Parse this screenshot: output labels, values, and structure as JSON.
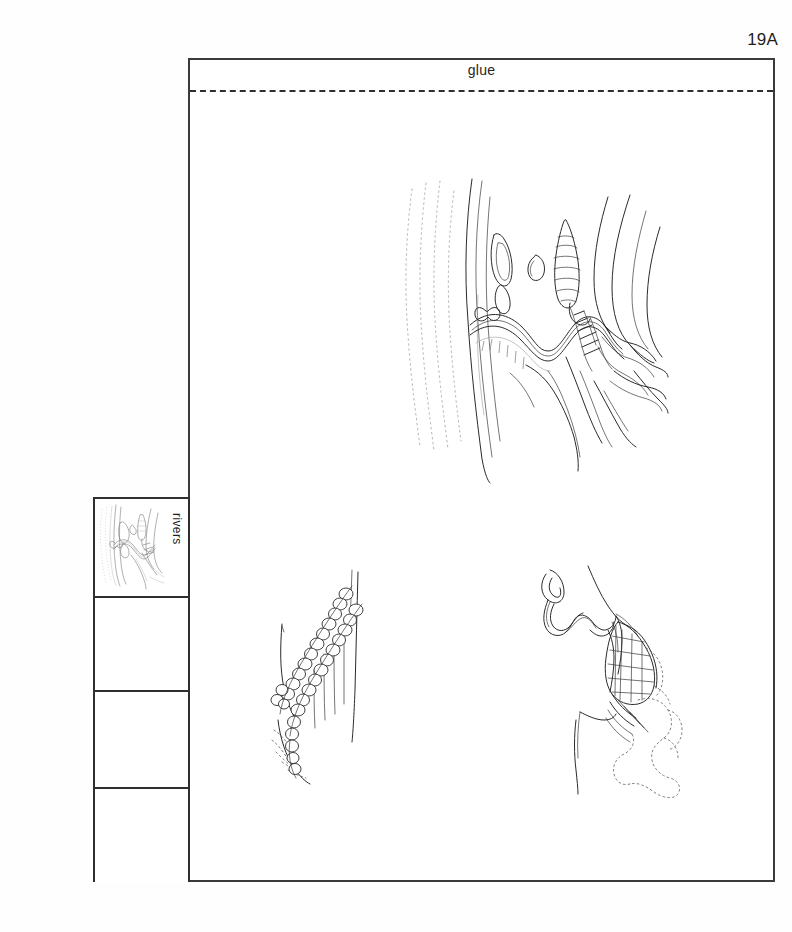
{
  "page": {
    "number_label": "19A",
    "background_color": "#fefefe",
    "ink_color": "#2b2b2b"
  },
  "main_panel": {
    "glue": {
      "label": "glue",
      "separator_style": "dashed"
    }
  },
  "sidebar": {
    "cells": [
      {
        "label": "rivers",
        "has_thumbnail": true
      },
      {
        "label": "",
        "has_thumbnail": false
      },
      {
        "label": "",
        "has_thumbnail": false
      },
      {
        "label": "",
        "has_thumbnail": false
      }
    ]
  },
  "illustrations": [
    {
      "id": "meandering-river",
      "name": "meandering river valley with oxbow lake and conical hills",
      "position": "upper-right"
    },
    {
      "id": "braided-river",
      "name": "braided river channel with boulder bars",
      "position": "lower-left"
    },
    {
      "id": "river-delta",
      "name": "meandering river with delta and alluvial fan",
      "position": "lower-right"
    }
  ]
}
